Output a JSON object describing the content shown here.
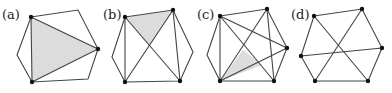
{
  "figure": {
    "panels": [
      {
        "id": "a",
        "label": "(a)",
        "label_pos": [
          2,
          19
        ],
        "hexagon": [
          [
            31,
            17
          ],
          [
            78,
            10
          ],
          [
            98,
            49
          ],
          [
            88,
            79
          ],
          [
            32,
            82
          ],
          [
            17,
            55
          ]
        ],
        "dots": [
          [
            31,
            17
          ],
          [
            98,
            49
          ],
          [
            32,
            82
          ]
        ],
        "chords": [
          [
            [
              31,
              17
            ],
            [
              32,
              82
            ]
          ],
          [
            [
              31,
              17
            ],
            [
              98,
              49
            ]
          ],
          [
            [
              32,
              82
            ],
            [
              98,
              49
            ]
          ]
        ],
        "shaded": [
          [
            31,
            17
          ],
          [
            98,
            49
          ],
          [
            32,
            82
          ]
        ]
      },
      {
        "id": "b",
        "label": "(b)",
        "label_pos": [
          103,
          19
        ],
        "hexagon": [
          [
            125,
            17
          ],
          [
            173,
            10
          ],
          [
            193,
            52
          ],
          [
            180,
            81
          ],
          [
            125,
            82
          ],
          [
            112,
            57
          ]
        ],
        "dots": [
          [
            125,
            17
          ],
          [
            173,
            10
          ],
          [
            180,
            81
          ],
          [
            125,
            82
          ]
        ],
        "chords": [
          [
            [
              125,
              17
            ],
            [
              125,
              82
            ]
          ],
          [
            [
              173,
              10
            ],
            [
              180,
              81
            ]
          ],
          [
            [
              125,
              17
            ],
            [
              180,
              81
            ]
          ],
          [
            [
              173,
              10
            ],
            [
              125,
              82
            ]
          ]
        ],
        "shaded": [
          [
            125,
            17
          ],
          [
            173,
            10
          ],
          [
            149,
            46
          ]
        ]
      },
      {
        "id": "c",
        "label": "(c)",
        "label_pos": [
          197,
          19
        ],
        "hexagon": [
          [
            220,
            16
          ],
          [
            267,
            9
          ],
          [
            287,
            48
          ],
          [
            274,
            81
          ],
          [
            220,
            81
          ],
          [
            207,
            55
          ]
        ],
        "dots": [
          [
            220,
            16
          ],
          [
            267,
            9
          ],
          [
            287,
            48
          ],
          [
            274,
            81
          ],
          [
            220,
            81
          ]
        ],
        "chords": [
          [
            [
              220,
              16
            ],
            [
              220,
              81
            ]
          ],
          [
            [
              267,
              9
            ],
            [
              274,
              81
            ]
          ],
          [
            [
              220,
              16
            ],
            [
              274,
              81
            ]
          ],
          [
            [
              267,
              9
            ],
            [
              220,
              81
            ]
          ],
          [
            [
              220,
              16
            ],
            [
              287,
              48
            ]
          ],
          [
            [
              220,
              81
            ],
            [
              287,
              48
            ]
          ]
        ],
        "shaded": [
          [
            220,
            81
          ],
          [
            243,
            50
          ],
          [
            262,
            65
          ]
        ]
      },
      {
        "id": "d",
        "label": "(d)",
        "label_pos": [
          291,
          19
        ],
        "hexagon": [
          [
            314,
            16
          ],
          [
            362,
            9
          ],
          [
            382,
            48
          ],
          [
            368,
            81
          ],
          [
            315,
            81
          ],
          [
            301,
            56
          ]
        ],
        "dots": [
          [
            314,
            16
          ],
          [
            362,
            9
          ],
          [
            382,
            48
          ],
          [
            368,
            81
          ],
          [
            315,
            81
          ],
          [
            301,
            56
          ]
        ],
        "chords": [
          [
            [
              314,
              16
            ],
            [
              368,
              81
            ]
          ],
          [
            [
              362,
              9
            ],
            [
              315,
              81
            ]
          ],
          [
            [
              301,
              56
            ],
            [
              382,
              48
            ]
          ]
        ],
        "shaded": []
      }
    ]
  }
}
